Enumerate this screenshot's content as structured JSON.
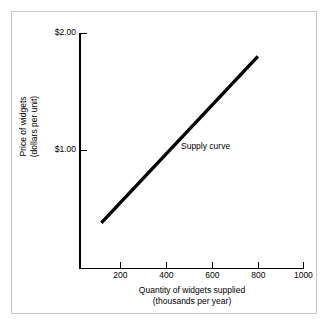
{
  "chart_data": {
    "type": "line",
    "title": "",
    "xlabel": "Quantity of widgets supplied",
    "xlabel_sub": "(thousands per year)",
    "ylabel": "Price of widgets",
    "ylabel_sub": "(dollars per unit)",
    "xlim": [
      0,
      1000
    ],
    "ylim": [
      0,
      2.0
    ],
    "grid": false,
    "legend": "none",
    "x_ticks": [
      {
        "value": 200,
        "label": "200"
      },
      {
        "value": 400,
        "label": "400"
      },
      {
        "value": 600,
        "label": "600"
      },
      {
        "value": 800,
        "label": "800"
      },
      {
        "value": 1000,
        "label": "1000"
      }
    ],
    "y_ticks": [
      {
        "value": 1.0,
        "label": "$1.00"
      },
      {
        "value": 2.0,
        "label": "$2.00"
      }
    ],
    "series": [
      {
        "name": "Supply curve",
        "x": [
          100,
          800
        ],
        "values": [
          0.38,
          1.8
        ],
        "style": "solid",
        "color": "#000000",
        "width_px": 3.4
      }
    ],
    "annotations": [
      {
        "text": "Supply curve",
        "x": 560,
        "y": 1.05
      }
    ]
  },
  "figure": {
    "background": "#ffffff",
    "frame_color": "#c9c9c9",
    "axis_color": "#000000"
  }
}
